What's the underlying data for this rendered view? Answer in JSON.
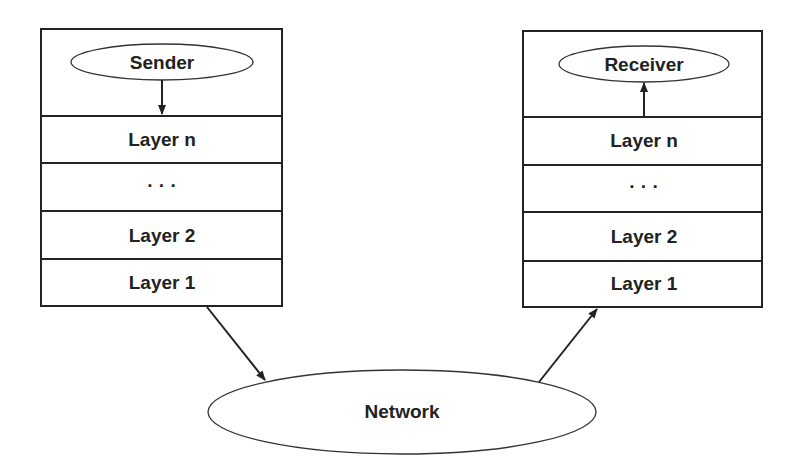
{
  "diagram": {
    "type": "layered-protocol-communication",
    "sender_stack": {
      "top": "Sender",
      "layers": [
        "Layer n",
        "...",
        "Layer 2",
        "Layer 1"
      ]
    },
    "receiver_stack": {
      "top": "Receiver",
      "layers": [
        "Layer n",
        "...",
        "Layer 2",
        "Layer 1"
      ]
    },
    "network": "Network",
    "edges": [
      {
        "from": "Sender",
        "to": "Layer n (sender)",
        "direction": "down"
      },
      {
        "from": "Layer 1 (sender)",
        "to": "Network"
      },
      {
        "from": "Network",
        "to": "Layer 1 (receiver)"
      },
      {
        "from": "Layer n (receiver)",
        "to": "Receiver",
        "direction": "up"
      }
    ],
    "colors": {
      "stroke": "#222222",
      "background": "#ffffff"
    }
  }
}
